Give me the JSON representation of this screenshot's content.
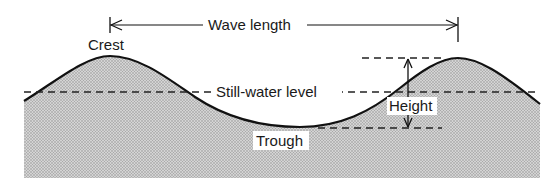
{
  "diagram": {
    "type": "wave-anatomy",
    "labels": {
      "crest": "Crest",
      "wave_length": "Wave length",
      "still_water_level": "Still-water level",
      "height": "Height",
      "trough": "Trough"
    },
    "colors": {
      "line": "#111111",
      "water_fill": "#c9c9c9",
      "water_dots": "#8a8a8a",
      "background": "#ffffff"
    }
  }
}
